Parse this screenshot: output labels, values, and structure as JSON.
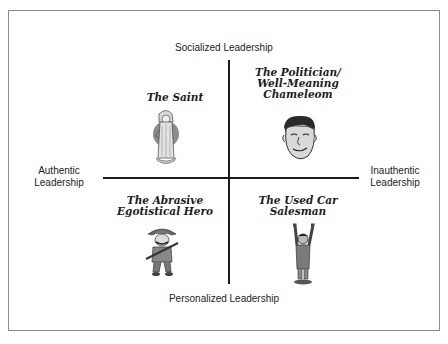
{
  "axes": {
    "top": "Socialized Leadership",
    "bottom": "Personalized Leadership",
    "left": [
      "Authentic",
      "Leadership"
    ],
    "right": [
      "Inauthentic",
      "Leadership"
    ]
  },
  "quadrants": {
    "top_left": {
      "title": [
        "The Saint"
      ],
      "icon": "saint-figure-icon"
    },
    "top_right": {
      "title": [
        "The Politician/",
        "Well-Meaning",
        "Chameleom"
      ],
      "icon": "politician-caricature-icon"
    },
    "bottom_left": {
      "title": [
        "The Abrasive",
        "Egotistical Hero"
      ],
      "icon": "cowboy-hero-icon"
    },
    "bottom_right": {
      "title": [
        "The Used Car",
        "Salesman"
      ],
      "icon": "salesman-arms-up-icon"
    }
  }
}
